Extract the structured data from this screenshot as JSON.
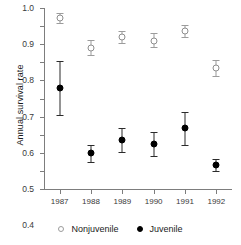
{
  "chart_data": {
    "type": "scatter",
    "title": "",
    "xlabel": "",
    "ylabel": "Annual survival rate",
    "categories": [
      "1987",
      "1988",
      "1989",
      "1990",
      "1991",
      "1992"
    ],
    "ylim": [
      0.0,
      1.0
    ],
    "yticks": [
      "0.0",
      "0.1",
      "0.2",
      "0.3",
      "0.4",
      "0.5",
      "0.6",
      "0.7",
      "0.8",
      "0.9",
      "1.0"
    ],
    "ytick_values": [
      0.0,
      0.1,
      0.2,
      0.3,
      0.4,
      0.5,
      0.6,
      0.7,
      0.8,
      0.9,
      1.0
    ],
    "grid": false,
    "legend_position": "bottom",
    "error_bars": "vertical",
    "series": [
      {
        "name": "Nonjuvenile",
        "marker": "open-circle",
        "color": "#9c9c9c",
        "values": [
          0.945,
          0.78,
          0.84,
          0.82,
          0.875,
          0.67
        ],
        "err_low": [
          0.915,
          0.74,
          0.805,
          0.785,
          0.84,
          0.625
        ],
        "err_high": [
          0.975,
          0.825,
          0.875,
          0.86,
          0.905,
          0.715
        ]
      },
      {
        "name": "Juvenile",
        "marker": "filled-circle",
        "color": "#000000",
        "values": [
          0.56,
          0.2,
          0.27,
          0.25,
          0.335,
          0.13
        ],
        "err_low": [
          0.41,
          0.15,
          0.205,
          0.185,
          0.245,
          0.1
        ],
        "err_high": [
          0.705,
          0.245,
          0.335,
          0.315,
          0.425,
          0.165
        ]
      }
    ]
  },
  "legend": {
    "entries": [
      {
        "label": "Nonjuvenile",
        "marker": "open-circle"
      },
      {
        "label": "Juvenile",
        "marker": "filled-circle"
      }
    ]
  }
}
